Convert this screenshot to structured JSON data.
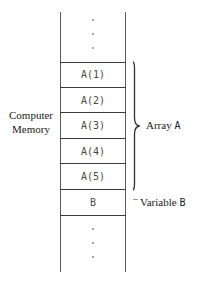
{
  "figure": {
    "memory_caption_line1": "Computer",
    "memory_caption_line2": "Memory",
    "array_caption_prefix": "Array",
    "array_caption_name": "A",
    "variable_caption_prefix": "Variable",
    "variable_caption_name": "B",
    "ellipsis_dot_count_top": 3,
    "ellipsis_dot_count_bottom": 3,
    "line_color": "#4a4a4a",
    "text_color": "#1a1a1a",
    "background_color": "#ffffff"
  },
  "memory_cells": [
    {
      "label": "A(1)"
    },
    {
      "label": "A(2)"
    },
    {
      "label": "A(3)"
    },
    {
      "label": "A(4)"
    },
    {
      "label": "A(5)"
    },
    {
      "label": "B"
    }
  ]
}
